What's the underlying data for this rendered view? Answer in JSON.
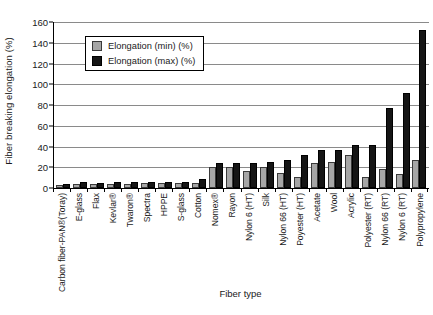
{
  "chart_data": {
    "type": "bar",
    "title": "",
    "xlabel": "Fiber type",
    "ylabel": "Fiber breaking elongation (%)",
    "ylim": [
      0,
      160
    ],
    "yticks": [
      0,
      20,
      40,
      60,
      80,
      100,
      120,
      140,
      160
    ],
    "grid": true,
    "legend_position": "upper-left-inside",
    "categories": [
      "Carbon fiber-PAN®(Toray)",
      "E-glass",
      "Flax",
      "Kevlar®",
      "Twaron®",
      "Spectra",
      "HPPE",
      "S-glass",
      "Cotton",
      "Nomex®",
      "Rayon",
      "Nylon 6 (HT)",
      "Silk",
      "Nylon 66 (HT)",
      "Poyester (HT)",
      "Acetate",
      "Wool",
      "Acrylic",
      "Polyester (RT)",
      "Nylon 66 (RT)",
      "Nylon 6 (RT)",
      "Polypropylene"
    ],
    "series": [
      {
        "name": "Elongation (min) (%)",
        "color": "#a6a6a6",
        "values": [
          1.4,
          1.8,
          1.8,
          2.4,
          2.4,
          2.7,
          2.7,
          2.9,
          3.0,
          18,
          18,
          14,
          18,
          13,
          9,
          22,
          23,
          30,
          9,
          16,
          12,
          25
        ]
      },
      {
        "name": "Elongation (max) (%)",
        "color": "#151515",
        "values": [
          2.0,
          3.5,
          3.3,
          3.6,
          3.6,
          3.6,
          3.6,
          3.4,
          7.0,
          22,
          22,
          22,
          23,
          25,
          30,
          35,
          35,
          40,
          40,
          75,
          90,
          150
        ]
      }
    ]
  },
  "legend": {
    "items": [
      {
        "label": "Elongation (min) (%)",
        "swatch": "gray-square-swatch"
      },
      {
        "label": "Elongation (max) (%)",
        "swatch": "black-square-swatch"
      }
    ]
  }
}
